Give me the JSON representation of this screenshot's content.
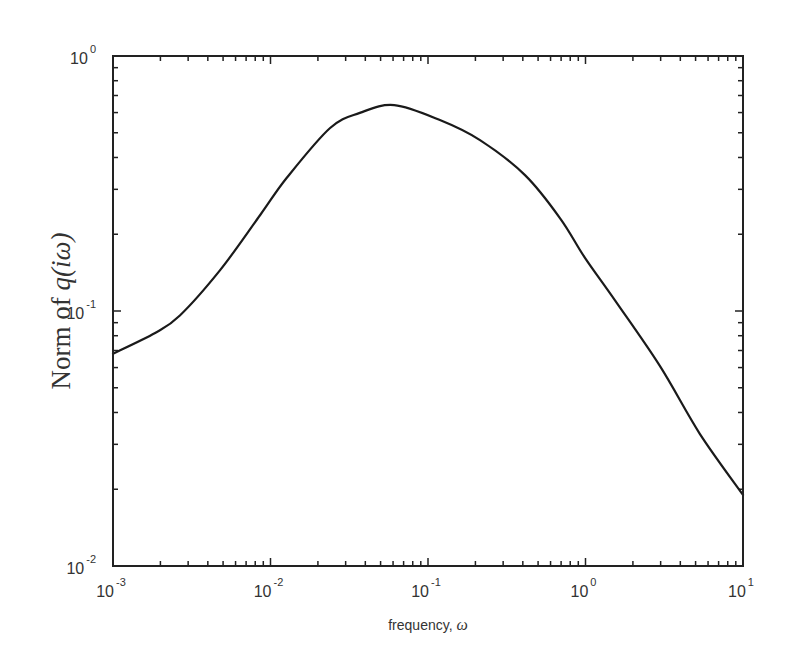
{
  "chart_data": {
    "type": "line",
    "title": "",
    "xlabel": "frequency, ω",
    "ylabel": "Norm of q(iω)",
    "xscale": "log",
    "yscale": "log",
    "xlim": [
      0.001,
      10
    ],
    "ylim": [
      0.01,
      1
    ],
    "grid": false,
    "legend": null,
    "x_ticks": [
      {
        "base": "10",
        "exp": "-3",
        "value": 0.001
      },
      {
        "base": "10",
        "exp": "-2",
        "value": 0.01
      },
      {
        "base": "10",
        "exp": "-1",
        "value": 0.1
      },
      {
        "base": "10",
        "exp": "0",
        "value": 1
      },
      {
        "base": "10",
        "exp": "1",
        "value": 10
      }
    ],
    "y_ticks": [
      {
        "base": "10",
        "exp": "-2",
        "value": 0.01
      },
      {
        "base": "10",
        "exp": "-1",
        "value": 0.1
      },
      {
        "base": "10",
        "exp": "0",
        "value": 1
      }
    ],
    "series": [
      {
        "name": "Norm of q(iω)",
        "color": "#1a1a1a",
        "x": [
          0.001,
          0.00185,
          0.00266,
          0.0048,
          0.0086,
          0.0127,
          0.0239,
          0.0369,
          0.061,
          0.119,
          0.214,
          0.413,
          0.69,
          0.99,
          1.54,
          2.96,
          5.32,
          10
        ],
        "y": [
          0.068,
          0.082,
          0.096,
          0.145,
          0.238,
          0.333,
          0.522,
          0.598,
          0.642,
          0.561,
          0.468,
          0.341,
          0.231,
          0.162,
          0.11,
          0.061,
          0.033,
          0.019
        ]
      }
    ]
  },
  "labels": {
    "xlabel_text": "frequency, ",
    "xlabel_symbol": "ω",
    "ylabel_prefix": "Norm of ",
    "ylabel_italic": "q(iω)"
  }
}
